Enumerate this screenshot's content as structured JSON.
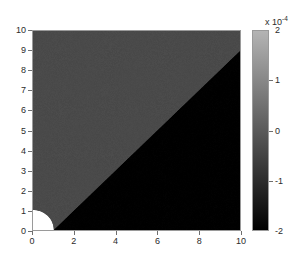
{
  "chart_data": {
    "type": "heatmap",
    "title": "",
    "xlabel": "",
    "ylabel": "",
    "xlim": [
      0,
      10
    ],
    "ylim": [
      0,
      10
    ],
    "grid": false,
    "colormap": "gray",
    "colorbar": {
      "position": "right",
      "orientation": "vertical",
      "exponent_label": "x 10",
      "exponent_value": "-4",
      "clim": [
        -2,
        2
      ],
      "ticks": [
        2,
        1,
        0,
        -1,
        -2
      ],
      "tick_labels": [
        "2",
        "1",
        "0",
        "-1",
        "-2"
      ],
      "top_color": "#b4b4b4",
      "bottom_color": "#000000"
    },
    "x_ticks": [
      0,
      2,
      4,
      6,
      8,
      10
    ],
    "x_tick_labels": [
      "0",
      "2",
      "4",
      "6",
      "8",
      "10"
    ],
    "y_ticks": [
      0,
      1,
      2,
      3,
      4,
      5,
      6,
      7,
      8,
      9,
      10
    ],
    "y_tick_labels": [
      "0",
      "1",
      "2",
      "3",
      "4",
      "5",
      "6",
      "7",
      "8",
      "9",
      "10"
    ],
    "regions": [
      {
        "name": "upper-left-region",
        "description": "region above the diagonal boundary",
        "fill_color": "#4a4a4a",
        "approx_value": -0.55
      },
      {
        "name": "lower-right-region",
        "description": "region below the diagonal boundary",
        "fill_color": "#000000",
        "approx_value": -2.0
      },
      {
        "name": "origin-quarter-disk",
        "description": "white quarter circle cut out at the origin",
        "fill_color": "#ffffff",
        "radius": 1.0,
        "center": [
          0,
          0
        ]
      }
    ],
    "boundary_line": {
      "name": "diagonal-boundary",
      "from": [
        1,
        0
      ],
      "to": [
        10,
        9
      ],
      "slope": 1.0
    }
  }
}
